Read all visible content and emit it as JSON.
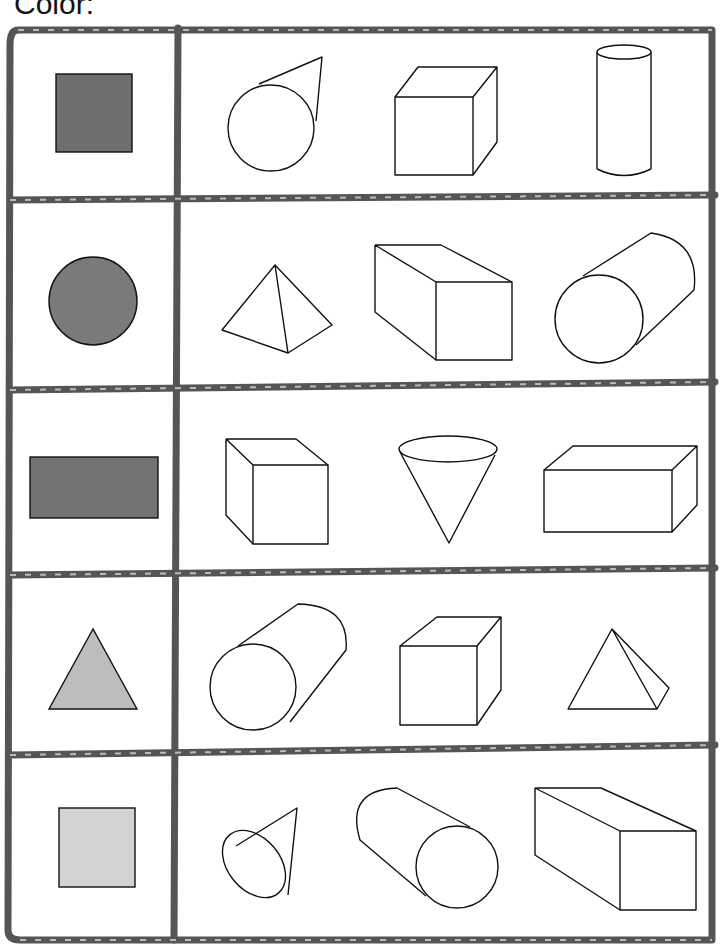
{
  "worksheet": {
    "title": "Color:",
    "rows": [
      {
        "key_shape": {
          "type": "square",
          "fill": "#6e6e6e"
        },
        "solids": [
          "cone",
          "cube",
          "cylinder"
        ]
      },
      {
        "key_shape": {
          "type": "circle",
          "fill": "#7a7a7a"
        },
        "solids": [
          "square-pyramid",
          "rectangular-prism",
          "cylinder"
        ]
      },
      {
        "key_shape": {
          "type": "rectangle",
          "fill": "#737373"
        },
        "solids": [
          "cube",
          "cone",
          "rectangular-prism"
        ]
      },
      {
        "key_shape": {
          "type": "triangle",
          "fill": "#bdbdbd"
        },
        "solids": [
          "cylinder",
          "cube",
          "triangular-pyramid"
        ]
      },
      {
        "key_shape": {
          "type": "square",
          "fill": "#d3d3d3"
        },
        "solids": [
          "cone",
          "cylinder",
          "rectangular-prism"
        ]
      }
    ],
    "colors": {
      "border_yarn": "#555555",
      "bead": "#6b6b6b",
      "outline": "#111111"
    }
  }
}
